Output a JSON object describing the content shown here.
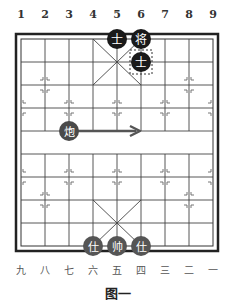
{
  "top_numbers": [
    "1",
    "2",
    "3",
    "4",
    "5",
    "6",
    "7",
    "8",
    "9"
  ],
  "bottom_numbers": [
    "九",
    "八",
    "七",
    "六",
    "五",
    "四",
    "三",
    "二",
    "一"
  ],
  "caption": "图一",
  "pieces": [
    {
      "id": "black-advisor-left",
      "label": "士",
      "side": "black",
      "col": 5,
      "row": 1
    },
    {
      "id": "black-general",
      "label": "将",
      "side": "black",
      "col": 6,
      "row": 1
    },
    {
      "id": "black-advisor-center",
      "label": "士",
      "side": "black",
      "col": 6,
      "row": 2,
      "highlighted": true
    },
    {
      "id": "red-cannon",
      "label": "炮",
      "side": "red",
      "col": 3,
      "row": 5
    },
    {
      "id": "red-advisor-left",
      "label": "仕",
      "side": "red",
      "col": 4,
      "row": 10
    },
    {
      "id": "red-marshal",
      "label": "帅",
      "side": "red",
      "col": 5,
      "row": 10
    },
    {
      "id": "red-advisor-right",
      "label": "仕",
      "side": "red",
      "col": 6,
      "row": 10
    }
  ],
  "arrow": {
    "from_col": 3,
    "to_col": 6,
    "row": 5,
    "color": "#555555"
  },
  "colors": {
    "black_piece": "#1a1a1a",
    "red_piece": "#555555",
    "grid": "#333333",
    "piece_text": "#ffffff"
  }
}
